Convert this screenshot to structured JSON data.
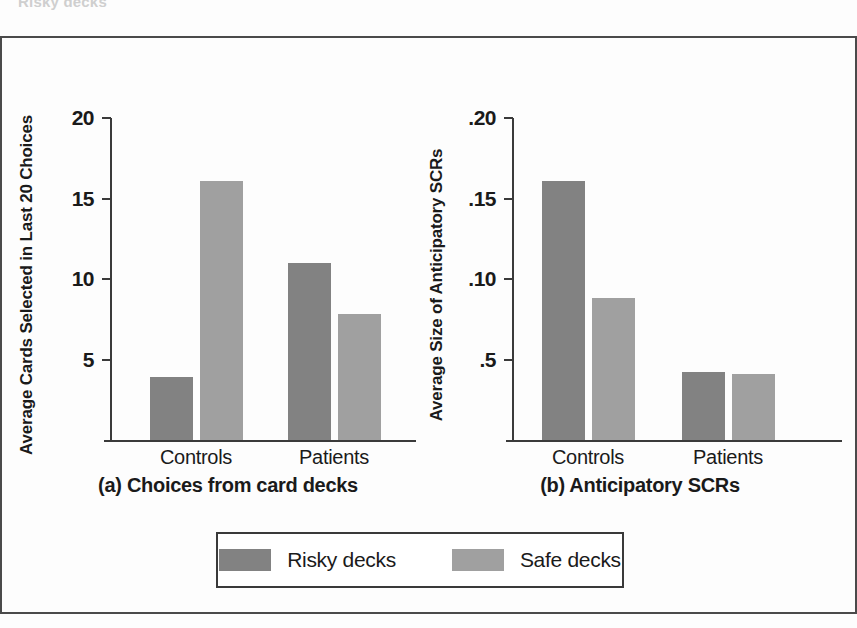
{
  "figure": {
    "bleed_text_top": "Risky decks"
  },
  "legend": {
    "items": [
      {
        "label": "Risky decks",
        "color": "#828282",
        "key": "risky"
      },
      {
        "label": "Safe decks",
        "color": "#a0a0a0",
        "key": "safe"
      }
    ]
  },
  "chart_data": [
    {
      "type": "bar",
      "panel": "a",
      "title": "(a) Choices from card decks",
      "ylabel": "Average Cards Selected in Last 20 Choices",
      "xlabel": "",
      "categories": [
        "Controls",
        "Patients"
      ],
      "series": [
        {
          "name": "Risky decks",
          "color": "#828282",
          "values": [
            3.9,
            11.0
          ]
        },
        {
          "name": "Safe decks",
          "color": "#a0a0a0",
          "values": [
            16.1,
            7.8
          ]
        }
      ],
      "ylim": [
        0,
        20
      ],
      "yticks": [
        0,
        5,
        10,
        15,
        20
      ],
      "ytick_labels": [
        "",
        "5",
        "10",
        "15",
        "20"
      ],
      "grid": false,
      "legend_position": "bottom"
    },
    {
      "type": "bar",
      "panel": "b",
      "title": "(b) Anticipatory SCRs",
      "ylabel": "Average Size of Anticipatory SCRs",
      "xlabel": "",
      "categories": [
        "Controls",
        "Patients"
      ],
      "series": [
        {
          "name": "Risky decks",
          "color": "#828282",
          "values": [
            0.161,
            0.042
          ]
        },
        {
          "name": "Safe decks",
          "color": "#a0a0a0",
          "values": [
            0.088,
            0.041
          ]
        }
      ],
      "ylim": [
        0,
        0.2
      ],
      "yticks": [
        0,
        0.05,
        0.1,
        0.15,
        0.2
      ],
      "ytick_labels": [
        "",
        ".5",
        ".10",
        ".15",
        ".20"
      ],
      "grid": false,
      "legend_position": "bottom"
    }
  ]
}
